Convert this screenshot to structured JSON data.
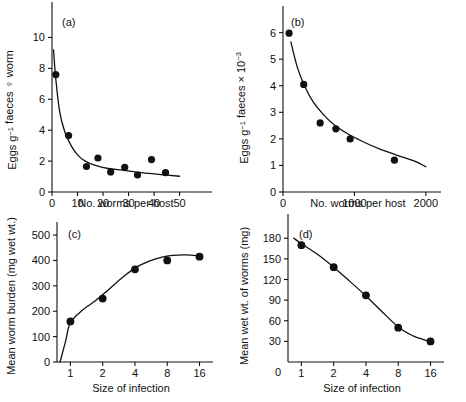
{
  "figure": {
    "background": "#ffffff",
    "ink": "#111111",
    "panels": [
      "a",
      "b",
      "c",
      "d"
    ]
  },
  "chart_data": [
    {
      "type": "scatter",
      "panel_label": "(a)",
      "title": "",
      "xlabel": "No. worms per host",
      "ylabel": "Eggs g⁻¹ faeces ♀ worm",
      "ylabel_parts": {
        "prefix": "Eggs g",
        "superscript": "−1",
        "middle": " faeces ",
        "symbol": "♀",
        "suffix": " worm"
      },
      "xlim": [
        0,
        58
      ],
      "ylim": [
        0,
        11
      ],
      "xticks": [
        0,
        10,
        20,
        30,
        40,
        50
      ],
      "yticks": [
        0,
        2,
        4,
        6,
        8,
        10
      ],
      "grid": false,
      "legend": "none",
      "points": [
        {
          "x": 1.5,
          "y": 7.6
        },
        {
          "x": 6.5,
          "y": 3.65
        },
        {
          "x": 13.5,
          "y": 1.65
        },
        {
          "x": 18.0,
          "y": 2.2
        },
        {
          "x": 23.0,
          "y": 1.3
        },
        {
          "x": 28.5,
          "y": 1.6
        },
        {
          "x": 33.5,
          "y": 1.1
        },
        {
          "x": 39.0,
          "y": 2.1
        },
        {
          "x": 44.5,
          "y": 1.25
        }
      ],
      "fit_curve": {
        "description": "decreasing power/hyperbolic fit",
        "points": [
          {
            "x": 0.6,
            "y": 9.2
          },
          {
            "x": 1.5,
            "y": 7.3
          },
          {
            "x": 3.0,
            "y": 5.2
          },
          {
            "x": 5.0,
            "y": 3.9
          },
          {
            "x": 7.5,
            "y": 3.0
          },
          {
            "x": 10.0,
            "y": 2.4
          },
          {
            "x": 13.0,
            "y": 2.0
          },
          {
            "x": 17.0,
            "y": 1.72
          },
          {
            "x": 22.0,
            "y": 1.52
          },
          {
            "x": 28.0,
            "y": 1.4
          },
          {
            "x": 35.0,
            "y": 1.25
          },
          {
            "x": 43.0,
            "y": 1.12
          },
          {
            "x": 50.0,
            "y": 1.02
          }
        ]
      }
    },
    {
      "type": "scatter",
      "panel_label": "(b)",
      "title": "",
      "xlabel": "No. worms per host",
      "ylabel": "Eggs g⁻¹ faeces × 10⁻³",
      "ylabel_parts": {
        "prefix": "Eggs g",
        "superscript": "−1",
        "middle": " faeces × 10",
        "superscript2": "−3"
      },
      "xlim": [
        0,
        2100
      ],
      "ylim": [
        0,
        6.4
      ],
      "xticks": [
        0,
        1000,
        2000
      ],
      "yticks": [
        0,
        1,
        2,
        3,
        4,
        5,
        6
      ],
      "grid": false,
      "legend": "none",
      "points": [
        {
          "x": 85,
          "y": 5.98
        },
        {
          "x": 290,
          "y": 4.05
        },
        {
          "x": 520,
          "y": 2.6
        },
        {
          "x": 740,
          "y": 2.38
        },
        {
          "x": 940,
          "y": 2.0
        },
        {
          "x": 1560,
          "y": 1.2
        }
      ],
      "fit_curve": {
        "description": "decreasing power fit",
        "points": [
          {
            "x": 110,
            "y": 5.65
          },
          {
            "x": 200,
            "y": 4.7
          },
          {
            "x": 300,
            "y": 4.0
          },
          {
            "x": 420,
            "y": 3.4
          },
          {
            "x": 560,
            "y": 2.93
          },
          {
            "x": 720,
            "y": 2.52
          },
          {
            "x": 900,
            "y": 2.2
          },
          {
            "x": 1100,
            "y": 1.92
          },
          {
            "x": 1350,
            "y": 1.62
          },
          {
            "x": 1600,
            "y": 1.38
          },
          {
            "x": 1850,
            "y": 1.15
          },
          {
            "x": 2000,
            "y": 0.95
          }
        ]
      }
    },
    {
      "type": "scatter",
      "panel_label": "(c)",
      "title": "",
      "xlabel": "Size of infection",
      "ylabel": "Mean worm burden (mg wet wt.)",
      "xscale": "log2",
      "xlim": [
        0.75,
        18
      ],
      "ylim": [
        0,
        520
      ],
      "xticks": [
        1,
        2,
        4,
        8,
        16
      ],
      "yticks": [
        0,
        100,
        200,
        300,
        400,
        500
      ],
      "grid": false,
      "legend": "none",
      "points": [
        {
          "x": 1,
          "y": 160
        },
        {
          "x": 2,
          "y": 250
        },
        {
          "x": 4,
          "y": 365
        },
        {
          "x": 8,
          "y": 400
        },
        {
          "x": 16,
          "y": 415
        }
      ],
      "fit_curve": {
        "description": "saturating (asymptotic) fit",
        "points": [
          {
            "x": 0.8,
            "y": 0
          },
          {
            "x": 0.9,
            "y": 80
          },
          {
            "x": 1.0,
            "y": 155
          },
          {
            "x": 1.3,
            "y": 205
          },
          {
            "x": 1.7,
            "y": 240
          },
          {
            "x": 2.2,
            "y": 280
          },
          {
            "x": 3.0,
            "y": 330
          },
          {
            "x": 4.0,
            "y": 370
          },
          {
            "x": 5.5,
            "y": 398
          },
          {
            "x": 7.0,
            "y": 412
          },
          {
            "x": 9.0,
            "y": 420
          },
          {
            "x": 12.0,
            "y": 422
          },
          {
            "x": 16.0,
            "y": 418
          }
        ]
      }
    },
    {
      "type": "scatter",
      "panel_label": "(d)",
      "title": "",
      "xlabel": "Size of infection",
      "ylabel": "Mean wet wt. of worms (mg)",
      "xscale": "log2",
      "xlim": [
        0.75,
        18
      ],
      "ylim": [
        0,
        192
      ],
      "xticks": [
        0,
        1,
        2,
        4,
        8,
        16
      ],
      "yticks": [
        30,
        60,
        90,
        120,
        150,
        180
      ],
      "grid": false,
      "legend": "none",
      "points": [
        {
          "x": 1,
          "y": 170
        },
        {
          "x": 2,
          "y": 138
        },
        {
          "x": 4,
          "y": 97
        },
        {
          "x": 8,
          "y": 50
        },
        {
          "x": 16,
          "y": 30
        }
      ],
      "fit_curve": {
        "description": "decaying exponential fit",
        "points": [
          {
            "x": 0.85,
            "y": 180
          },
          {
            "x": 1.0,
            "y": 172
          },
          {
            "x": 1.4,
            "y": 157
          },
          {
            "x": 2.0,
            "y": 138
          },
          {
            "x": 2.8,
            "y": 118
          },
          {
            "x": 4.0,
            "y": 96
          },
          {
            "x": 5.5,
            "y": 75
          },
          {
            "x": 8.0,
            "y": 51
          },
          {
            "x": 11.0,
            "y": 38
          },
          {
            "x": 13.5,
            "y": 33
          },
          {
            "x": 16.0,
            "y": 30
          }
        ]
      }
    }
  ]
}
